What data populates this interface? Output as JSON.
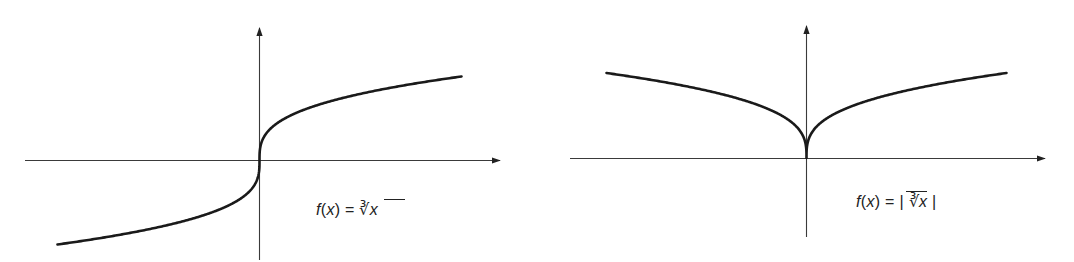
{
  "chart_data": [
    {
      "type": "line",
      "title": "",
      "function": "cube root",
      "annotation": "f(x) = ∛x",
      "xlabel": "",
      "ylabel": "",
      "grid": false,
      "legend": "none",
      "axes": {
        "arrows": true,
        "ticks": false
      },
      "x_range": [
        -1,
        1
      ],
      "y_range": [
        -1,
        1
      ],
      "x": [
        -1.0,
        -0.75,
        -0.5,
        -0.25,
        -0.1,
        -0.01,
        0,
        0.01,
        0.1,
        0.25,
        0.5,
        0.75,
        1.0
      ],
      "values": [
        -1.0,
        -0.909,
        -0.794,
        -0.63,
        -0.464,
        -0.215,
        0,
        0.215,
        0.464,
        0.63,
        0.794,
        0.909,
        1.0
      ]
    },
    {
      "type": "line",
      "title": "",
      "function": "absolute value of cube root",
      "annotation": "f(x) = |∛x|",
      "xlabel": "",
      "ylabel": "",
      "grid": false,
      "legend": "none",
      "axes": {
        "arrows": true,
        "ticks": false
      },
      "x_range": [
        -1,
        1
      ],
      "y_range": [
        0,
        1
      ],
      "x": [
        -1.0,
        -0.75,
        -0.5,
        -0.25,
        -0.1,
        -0.01,
        0,
        0.01,
        0.1,
        0.25,
        0.5,
        0.75,
        1.0
      ],
      "values": [
        1.0,
        0.909,
        0.794,
        0.63,
        0.464,
        0.215,
        0,
        0.215,
        0.464,
        0.63,
        0.794,
        0.909,
        1.0
      ]
    }
  ],
  "plots": {
    "left": {
      "label": {
        "prefix": "f",
        "paren_open": "(",
        "var": "x",
        "paren_close": ")",
        "eq": " = ",
        "root": "∛",
        "arg": "x",
        "abs_open": "",
        "abs_close": ""
      }
    },
    "right": {
      "label": {
        "prefix": "f",
        "paren_open": "(",
        "var": "x",
        "paren_close": ")",
        "eq": " = ",
        "root": "∛",
        "arg": "x",
        "abs_open": "| ",
        "abs_close": " |"
      }
    }
  },
  "colors": {
    "axis": "#3a3a3a",
    "curve": "#1a1a1a",
    "background": "#ffffff"
  }
}
